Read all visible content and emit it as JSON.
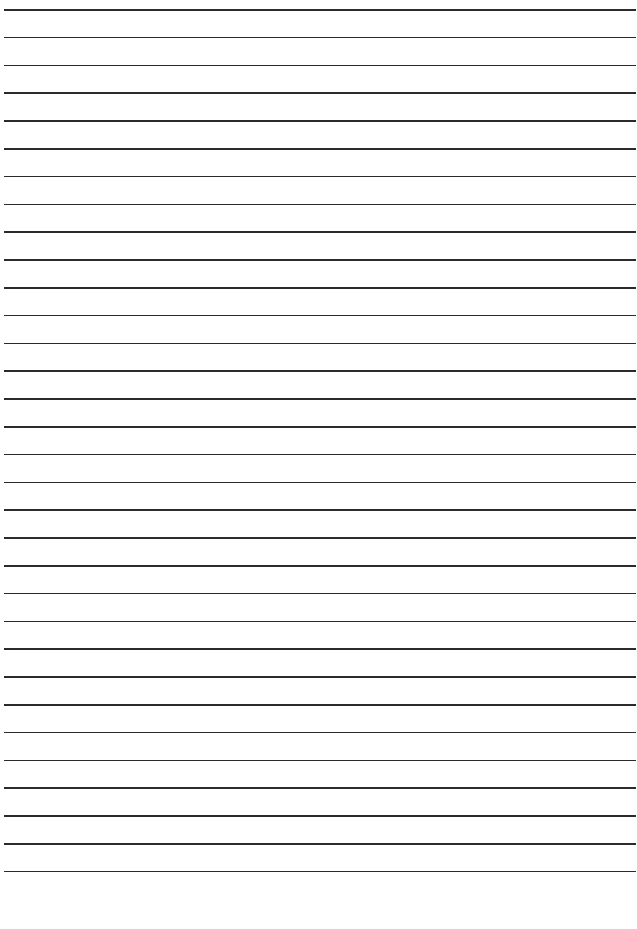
{
  "paper": {
    "line_count": 32,
    "first_line_y": 9,
    "line_spacing": 27.8,
    "line_color": "#2b2b2b",
    "background": "#ffffff"
  }
}
